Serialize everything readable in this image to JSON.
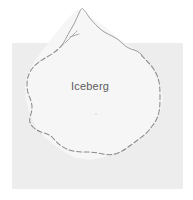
{
  "figure": {
    "kind": "hand-drawn-map-sketch",
    "label": "Iceberg",
    "background_color": "#ffffff",
    "panel_color": "#ededed",
    "interior_color": "#f6f6f6",
    "contour_color": "#8a8a8a",
    "label_color": "#5c5c5c",
    "panel": {
      "x": 12,
      "y": 43,
      "width": 171,
      "height": 146
    },
    "label_position": {
      "x": 71,
      "y": 80
    },
    "annotations": {
      "contour_style": "dashed",
      "peak_style": "solid",
      "peak_extends_above_panel": "true"
    }
  }
}
